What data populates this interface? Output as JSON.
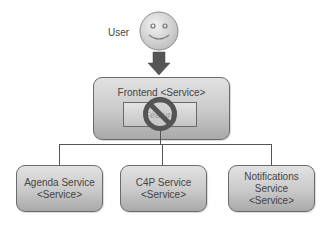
{
  "diagram": {
    "user": {
      "label": "User",
      "icon": "smiley-face-icon"
    },
    "arrow": {
      "icon": "down-arrow-icon",
      "color": "#555555"
    },
    "frontend": {
      "title": "Frontend <Service>",
      "inner_component": {
        "label": "Feature",
        "status_icon": "prohibited-icon",
        "status": "blocked"
      }
    },
    "services": [
      {
        "name": "Agenda Service",
        "type": "<Service>"
      },
      {
        "name": "C4P Service",
        "type": "<Service>"
      },
      {
        "name": "Notifications Service",
        "type": "<Service>"
      }
    ],
    "colors": {
      "box_fill_top": "#e2e2e2",
      "box_fill_bottom": "#a9a9a9",
      "border": "#6a6a6a",
      "connector": "#555555",
      "face_fill": "#dcdcdc",
      "prohibited": "#555555"
    }
  }
}
